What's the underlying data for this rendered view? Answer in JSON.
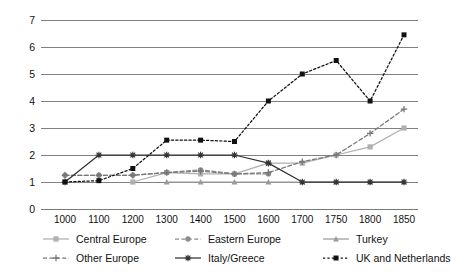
{
  "chart_data": {
    "type": "line",
    "title": "",
    "xlabel": "",
    "ylabel": "Institutional index",
    "grid": true,
    "legend_position": "bottom",
    "ylim": [
      0,
      7
    ],
    "yticks": [
      "0",
      "1",
      "2",
      "3",
      "4",
      "5",
      "6",
      "7"
    ],
    "categories": [
      "1000",
      "1100",
      "1200",
      "1300",
      "1400",
      "1500",
      "1600",
      "1700",
      "1750",
      "1800",
      "1850"
    ],
    "x": [
      1000,
      1100,
      1200,
      1300,
      1400,
      1500,
      1600,
      1700,
      1750,
      1800,
      1850
    ],
    "series": [
      {
        "name": "Central Europe",
        "color": "#b0b0b0",
        "line": "solid",
        "marker": "square",
        "values": [
          null,
          null,
          1.0,
          1.35,
          1.3,
          1.3,
          1.7,
          1.7,
          2.0,
          2.3,
          3.0
        ]
      },
      {
        "name": "Eastern Europe",
        "color": "#8c8c8c",
        "line": "dashed",
        "marker": "circle",
        "values": [
          1.25,
          1.25,
          1.25,
          1.35,
          1.45,
          1.3,
          1.3,
          null,
          null,
          null,
          null
        ]
      },
      {
        "name": "Turkey",
        "color": "#9a9a9a",
        "line": "solid",
        "marker": "triangle",
        "values": [
          null,
          null,
          null,
          1.0,
          1.0,
          1.0,
          1.0,
          1.0,
          1.0,
          1.0,
          1.0
        ]
      },
      {
        "name": "Other Europe",
        "color": "#777777",
        "line": "dashed",
        "marker": "plus",
        "values": [
          1.25,
          1.25,
          1.25,
          1.35,
          1.4,
          1.3,
          1.35,
          1.75,
          2.0,
          2.8,
          3.7
        ]
      },
      {
        "name": "Italy/Greece",
        "color": "#333333",
        "line": "solid",
        "marker": "star",
        "values": [
          1.0,
          2.0,
          2.0,
          2.0,
          2.0,
          2.0,
          1.7,
          1.0,
          1.0,
          1.0,
          1.0
        ]
      },
      {
        "name": "UK and Netherlands",
        "color": "#111111",
        "line": "dotted",
        "marker": "filled-square",
        "values": [
          1.0,
          1.05,
          1.5,
          2.55,
          2.55,
          2.5,
          4.0,
          5.0,
          5.5,
          4.0,
          6.45
        ]
      }
    ]
  },
  "axes": {
    "y_title": "Institutional index"
  },
  "legend": {
    "rows": [
      [
        "Central Europe",
        "Eastern Europe",
        "Turkey"
      ],
      [
        "Other Europe",
        "Italy/Greece",
        "UK and Netherlands"
      ]
    ]
  }
}
